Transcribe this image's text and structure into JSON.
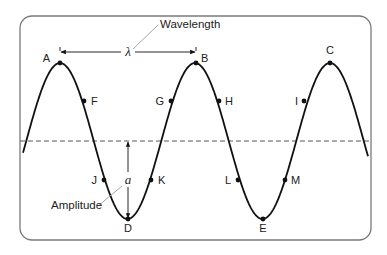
{
  "diagram": {
    "colors": {
      "frame": "#7a7a7a",
      "curve": "#111111",
      "midline": "#444444",
      "leader": "#9a9a9a",
      "text": "#222222"
    },
    "frame": {
      "x": 20,
      "y": 16,
      "width": 351,
      "height": 224,
      "radius": 12
    },
    "wave": {
      "x_start": 23,
      "x_end": 368,
      "peak_x": 60,
      "wavelength_px": 135,
      "midline_y": 141,
      "amplitude_px": 78
    },
    "labels": {
      "wavelength": "Wavelength",
      "lambda": "λ",
      "amplitude": "Amplitude",
      "amplitude_symbol": "a"
    },
    "points": [
      {
        "id": "A",
        "label": "A",
        "x": 60,
        "y": 63,
        "lx": 50,
        "ly": 62,
        "anchor": "end"
      },
      {
        "id": "B",
        "label": "B",
        "x": 196,
        "y": 63,
        "lx": 201,
        "ly": 62,
        "anchor": "start"
      },
      {
        "id": "C",
        "label": "C",
        "x": 330,
        "y": 63,
        "lx": 330,
        "ly": 54,
        "anchor": "middle"
      },
      {
        "id": "D",
        "label": "D",
        "x": 128,
        "y": 219,
        "lx": 128,
        "ly": 232,
        "anchor": "middle"
      },
      {
        "id": "E",
        "label": "E",
        "x": 263,
        "y": 219,
        "lx": 263,
        "ly": 232,
        "anchor": "middle"
      },
      {
        "id": "F",
        "label": "F",
        "x": 84,
        "y": 101,
        "lx": 91,
        "ly": 105,
        "anchor": "start"
      },
      {
        "id": "G",
        "label": "G",
        "x": 171,
        "y": 101,
        "lx": 164,
        "ly": 105,
        "anchor": "end"
      },
      {
        "id": "H",
        "label": "H",
        "x": 219,
        "y": 101,
        "lx": 225,
        "ly": 105,
        "anchor": "start"
      },
      {
        "id": "I",
        "label": "I",
        "x": 304,
        "y": 101,
        "lx": 298,
        "ly": 105,
        "anchor": "end"
      },
      {
        "id": "J",
        "label": "J",
        "x": 104,
        "y": 180,
        "lx": 97,
        "ly": 184,
        "anchor": "end"
      },
      {
        "id": "K",
        "label": "K",
        "x": 151,
        "y": 180,
        "lx": 158,
        "ly": 184,
        "anchor": "start"
      },
      {
        "id": "L",
        "label": "L",
        "x": 238,
        "y": 180,
        "lx": 231,
        "ly": 184,
        "anchor": "end"
      },
      {
        "id": "M",
        "label": "M",
        "x": 285,
        "y": 180,
        "lx": 291,
        "ly": 184,
        "anchor": "start"
      }
    ],
    "wavelength_arrow": {
      "x1": 60,
      "x2": 196,
      "y": 52,
      "label_x": 128,
      "label_y": 56
    },
    "wavelength_leader": {
      "x1": 133,
      "y1": 49,
      "x2": 158,
      "y2": 25,
      "text_x": 160,
      "text_y": 28
    },
    "amplitude_arrow": {
      "x": 128,
      "y1": 141,
      "y2": 219,
      "label_x": 128,
      "label_y": 184
    },
    "amplitude_leader": {
      "x1": 98,
      "y1": 206,
      "x2": 122,
      "y2": 186,
      "text_x": 51,
      "text_y": 209
    }
  }
}
